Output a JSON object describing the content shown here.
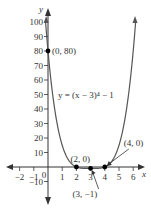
{
  "chart_data": {
    "type": "line",
    "title": "",
    "equation": "y = (x − 3)⁴ − 1",
    "xlabel": "x",
    "ylabel": "y",
    "xlim": [
      -2.5,
      6.7
    ],
    "ylim": [
      -25,
      108
    ],
    "x_ticks": [
      -2,
      -1,
      1,
      2,
      3,
      4,
      5,
      6
    ],
    "x_tick_labels": [
      "−2",
      "−1",
      "1",
      "2",
      "3",
      "4",
      "5",
      "6"
    ],
    "y_ticks": [
      -10,
      10,
      20,
      30,
      40,
      50,
      60,
      70,
      80,
      90,
      100
    ],
    "y_tick_labels": [
      "−10",
      "10",
      "20",
      "30",
      "40",
      "50",
      "60",
      "70",
      "80",
      "90",
      "100"
    ],
    "origin_label": "0",
    "series": [
      {
        "name": "y = (x − 3)^4 − 1",
        "function": "(x-3)^4-1",
        "x_range": [
          -0.2,
          6.2
        ]
      }
    ],
    "points": [
      {
        "x": 0,
        "y": 80,
        "label": "(0, 80)"
      },
      {
        "x": 2,
        "y": 0,
        "label": "(2, 0)"
      },
      {
        "x": 3,
        "y": -1,
        "label": "(3, −1)"
      },
      {
        "x": 4,
        "y": 0,
        "label": "(4, 0)"
      }
    ],
    "grid": false,
    "colors": {
      "curve": "#555555",
      "axes": "#333333",
      "points": "#000000"
    }
  }
}
